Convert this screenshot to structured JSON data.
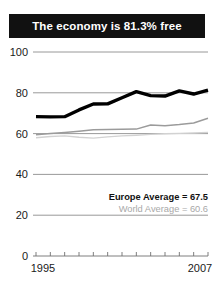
{
  "title": {
    "text": "The economy is 81.3% free"
  },
  "legend": {
    "europe_label": "Europe Average = 67.5",
    "world_label": "World Average = 60.6"
  },
  "colors": {
    "title_bar_bg": "#111111",
    "title_text": "#ffffff",
    "country_line": "#000000",
    "europe_line": "#9b9b9b",
    "world_line": "#d2d2d2",
    "gridline": "#8d8d8d",
    "axis_text": "#1a1a1a"
  },
  "chart_data": {
    "type": "line",
    "title": "The economy is 81.3% free",
    "xlabel": "",
    "ylabel": "",
    "ylim": [
      0,
      100
    ],
    "yticks": [
      0,
      20,
      40,
      60,
      80,
      100
    ],
    "xlim": [
      1995,
      2007
    ],
    "xticks": [
      1995,
      1996,
      1997,
      1998,
      1999,
      2000,
      2001,
      2002,
      2003,
      2004,
      2005,
      2006,
      2007
    ],
    "xtick_labels_shown": [
      "1995",
      "2007"
    ],
    "grid": true,
    "legend_position": "inside-lower-right",
    "x": [
      1995,
      1996,
      1997,
      1998,
      1999,
      2000,
      2001,
      2002,
      2003,
      2004,
      2005,
      2006,
      2007
    ],
    "series": [
      {
        "name": "Country",
        "color": "#000000",
        "width": "thick",
        "values": [
          68.3,
          68.2,
          68.3,
          71.6,
          74.5,
          74.6,
          77.6,
          80.6,
          78.6,
          78.4,
          80.9,
          79.4,
          81.3
        ]
      },
      {
        "name": "Europe Average",
        "color": "#9b9b9b",
        "width": "thin",
        "values": [
          59.4,
          60.1,
          60.6,
          61.2,
          61.9,
          62.0,
          62.1,
          62.2,
          64.2,
          63.9,
          64.4,
          65.2,
          67.5
        ]
      },
      {
        "name": "World Average",
        "color": "#d2d2d2",
        "width": "thin",
        "values": [
          58.0,
          58.6,
          58.9,
          58.2,
          57.8,
          58.4,
          58.9,
          59.2,
          59.6,
          59.9,
          60.1,
          60.3,
          60.6
        ]
      }
    ],
    "annotations": [
      {
        "text": "Europe Average = 67.5",
        "series": "Europe Average"
      },
      {
        "text": "World Average = 60.6",
        "series": "World Average"
      }
    ]
  }
}
